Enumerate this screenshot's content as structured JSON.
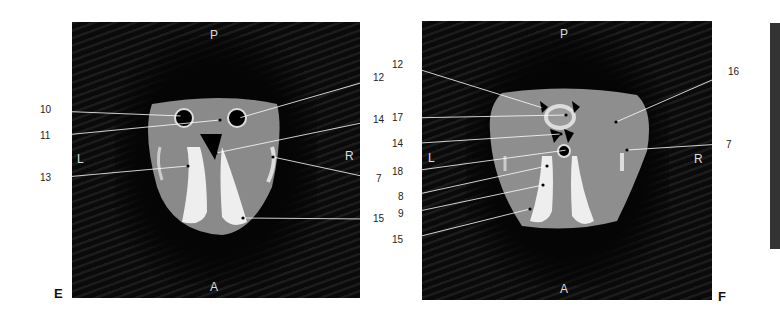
{
  "panels": [
    {
      "id": "E",
      "letter": "E",
      "orientation": {
        "top": "P",
        "bottom": "A",
        "left": "L",
        "right": "R"
      },
      "labels": [
        "10",
        "11",
        "12",
        "13",
        "14",
        "7",
        "15"
      ]
    },
    {
      "id": "F",
      "letter": "F",
      "orientation": {
        "top": "P",
        "bottom": "A",
        "left": "L",
        "right": "R"
      },
      "labels": [
        "12",
        "17",
        "14",
        "18",
        "8",
        "9",
        "15",
        "16",
        "7"
      ]
    }
  ]
}
